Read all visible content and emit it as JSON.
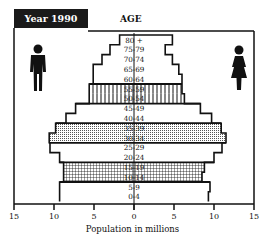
{
  "header": {
    "title": "Year 1990",
    "age_label": "AGE"
  },
  "icons": {
    "left": "male-figure-icon",
    "right": "female-figure-icon"
  },
  "axis": {
    "xlabel": "Population in millions",
    "ticks": [
      "15",
      "10",
      "5",
      "0",
      "5",
      "10",
      "15"
    ]
  },
  "chart_data": {
    "type": "bar",
    "subtype": "population-pyramid",
    "title": "Year 1990",
    "ylabel": "AGE",
    "xlabel": "Population in millions",
    "xlim": [
      -15,
      15
    ],
    "x_ticks": [
      15,
      10,
      5,
      0,
      5,
      10,
      15
    ],
    "grid": false,
    "legend": "male figure icon on left, female figure icon on right",
    "categories": [
      "80 +",
      "75-79",
      "70-74",
      "65-69",
      "60-64",
      "55-59",
      "50-54",
      "45-49",
      "40-44",
      "35-39",
      "30-34",
      "25-29",
      "20-24",
      "15-19",
      "10-14",
      "5-9",
      "0-4"
    ],
    "series": [
      {
        "name": "Male",
        "side": "left",
        "values": [
          1.8,
          3.0,
          4.0,
          5.1,
          5.1,
          5.6,
          5.6,
          7.3,
          8.5,
          9.8,
          10.6,
          10.5,
          9.3,
          8.8,
          8.8,
          9.3,
          9.3
        ]
      },
      {
        "name": "Female",
        "side": "right",
        "values": [
          4.8,
          3.9,
          4.8,
          5.6,
          6.0,
          6.0,
          6.3,
          8.3,
          9.7,
          10.9,
          11.5,
          11.0,
          10.0,
          8.8,
          8.5,
          9.5,
          9.3
        ]
      }
    ],
    "highlighted_groups": [
      {
        "ages": [
          "55-59",
          "50-54"
        ],
        "pattern": "vertical-lines"
      },
      {
        "ages": [
          "35-39",
          "30-34"
        ],
        "pattern": "dots"
      },
      {
        "ages": [
          "15-19",
          "10-14"
        ],
        "pattern": "grid"
      }
    ]
  }
}
